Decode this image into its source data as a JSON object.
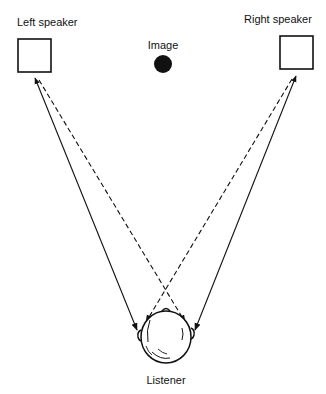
{
  "diagram": {
    "labels": {
      "left_speaker": "Left speaker",
      "right_speaker": "Right speaker",
      "image": "Image",
      "listener": "Listener"
    },
    "elements": {
      "left_speaker": "speaker-box",
      "right_speaker": "speaker-box",
      "image": "phantom-source-dot",
      "listener": "head-top-view"
    },
    "paths": [
      {
        "from": "left_speaker",
        "to": "listener_left_ear",
        "style": "solid",
        "arrow": "end",
        "meaning": "direct path"
      },
      {
        "from": "right_speaker",
        "to": "listener_right_ear",
        "style": "solid",
        "arrow": "end",
        "meaning": "direct path"
      },
      {
        "from": "left_speaker",
        "to": "listener_right_ear",
        "style": "dashed",
        "arrow": "end",
        "meaning": "crosstalk path"
      },
      {
        "from": "right_speaker",
        "to": "listener_left_ear",
        "style": "dashed",
        "arrow": "end",
        "meaning": "crosstalk path"
      }
    ],
    "colors": {
      "ink": "#111111",
      "background": "#ffffff"
    }
  }
}
